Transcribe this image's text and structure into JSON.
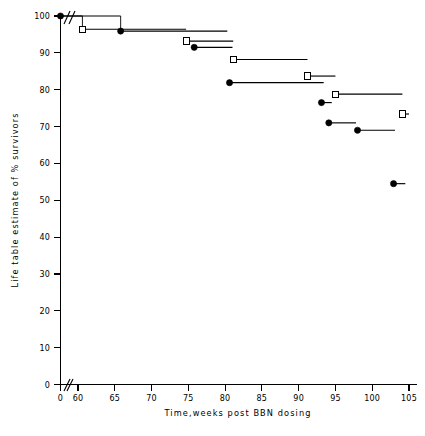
{
  "chart_data": {
    "type": "line",
    "title": "",
    "subtitle": "",
    "xlabel": "Time,weeks post BBN dosing",
    "ylabel": "Life table estimate of % survivors",
    "xlim": [
      0,
      105
    ],
    "ylim": [
      0,
      100
    ],
    "xticks": [
      0,
      60,
      65,
      70,
      75,
      80,
      85,
      90,
      95,
      100,
      105
    ],
    "xticklabels": [
      "0",
      "60",
      "65",
      "70",
      "75",
      "80",
      "85",
      "90",
      "95",
      "100",
      "105"
    ],
    "yticks": [
      0,
      10,
      20,
      30,
      40,
      50,
      60,
      70,
      80,
      90,
      100
    ],
    "yticklabels": [
      "0",
      "10",
      "20",
      "30",
      "40",
      "50",
      "60",
      "70",
      "80",
      "90",
      "100"
    ],
    "grid": false,
    "legend": "none",
    "axis_break": {
      "present": true,
      "axis": "x",
      "between": [
        0,
        60
      ],
      "glyph": "//"
    },
    "plot_style": "kaplan-meier step (life table survival)",
    "series": [
      {
        "name": "open-square-group",
        "marker": "open-square",
        "points": [
          {
            "x": 60.6,
            "y": 96.4
          },
          {
            "x": 74.7,
            "y": 93.2
          },
          {
            "x": 81.1,
            "y": 88.2
          },
          {
            "x": 91.2,
            "y": 83.7
          },
          {
            "x": 95.0,
            "y": 78.8
          },
          {
            "x": 104.1,
            "y": 73.4
          }
        ],
        "segments": [
          {
            "x0": 0.0,
            "x1": 60.6,
            "y": 100.0
          },
          {
            "x0": 60.6,
            "x1": 74.7,
            "y": 96.4
          },
          {
            "x0": 74.7,
            "x1": 81.1,
            "y": 93.2
          },
          {
            "x0": 81.1,
            "x1": 91.2,
            "y": 88.2
          },
          {
            "x0": 91.2,
            "x1": 95.0,
            "y": 83.7
          },
          {
            "x0": 95.0,
            "x1": 104.1,
            "y": 78.8
          },
          {
            "x0": 104.1,
            "x1": 105.0,
            "y": 73.4
          }
        ]
      },
      {
        "name": "filled-circle-group",
        "marker": "filled-circle",
        "points": [
          {
            "x": 65.8,
            "y": 95.9
          },
          {
            "x": 75.8,
            "y": 91.5
          },
          {
            "x": 80.6,
            "y": 81.9
          },
          {
            "x": 93.1,
            "y": 76.5
          },
          {
            "x": 94.1,
            "y": 71.0
          },
          {
            "x": 98.0,
            "y": 69.0
          },
          {
            "x": 102.9,
            "y": 54.5
          }
        ],
        "segments": [
          {
            "x0": 0.0,
            "x1": 65.8,
            "y": 100.0
          },
          {
            "x0": 65.8,
            "x1": 80.3,
            "y": 95.9
          },
          {
            "x0": 75.8,
            "x1": 81.0,
            "y": 91.5
          },
          {
            "x0": 80.6,
            "x1": 93.4,
            "y": 81.9
          },
          {
            "x0": 93.1,
            "x1": 94.5,
            "y": 76.5
          },
          {
            "x0": 94.1,
            "x1": 97.8,
            "y": 71.0
          },
          {
            "x0": 98.0,
            "x1": 103.1,
            "y": 69.0
          },
          {
            "x0": 102.9,
            "x1": 104.5,
            "y": 54.5
          }
        ]
      }
    ],
    "origin_marker": {
      "x": 0,
      "y": 100,
      "marker": "filled-circle"
    }
  },
  "axes": {
    "x_title": "Time,weeks post BBN dosing",
    "y_title": "Life table estimate of % survivors"
  }
}
